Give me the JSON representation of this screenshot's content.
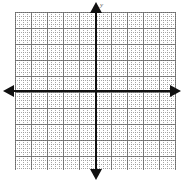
{
  "figure": {
    "kind": "cartesian-coordinate-grid",
    "title": "",
    "background_color": "#ffffff"
  },
  "axes": {
    "x_axis": {
      "label": "",
      "color": "#111111",
      "arrow_left": "arrow-left",
      "arrow_right": "arrow-right"
    },
    "y_axis": {
      "label": "y",
      "color": "#111111",
      "arrow_up": "arrow-up",
      "arrow_down": "arrow-down"
    },
    "origin_label": ""
  },
  "grid": {
    "minor_color": "#9a9a9a",
    "major_color": "#555555",
    "minor_spacing_px": 4,
    "major_spacing_px": 16,
    "minor_per_major": 4,
    "style": "dotted",
    "visible": true
  },
  "chart_data": {
    "type": "scatter",
    "title": "",
    "subtitle": "",
    "xlabel": "",
    "ylabel": "y",
    "series": [
      {
        "name": "",
        "x": [],
        "y": []
      }
    ],
    "x_tick_labels": [],
    "y_tick_labels": [],
    "xlim": [
      -10,
      10
    ],
    "ylim": [
      -10,
      10
    ],
    "grid": true,
    "legend": "none",
    "annotations": []
  }
}
